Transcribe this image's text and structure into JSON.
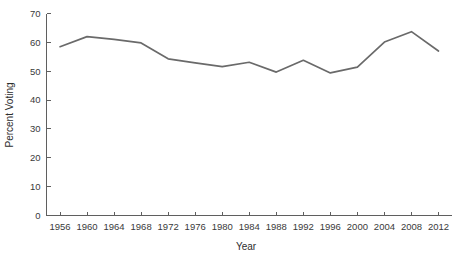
{
  "chart_data": {
    "type": "line",
    "title": "",
    "xlabel": "Year",
    "ylabel": "Percent Voting",
    "xlim": [
      1954,
      2014
    ],
    "ylim": [
      0,
      70
    ],
    "grid": false,
    "legend": "none",
    "x_ticks": [
      1956,
      1960,
      1964,
      1968,
      1972,
      1976,
      1980,
      1984,
      1988,
      1992,
      1996,
      2000,
      2004,
      2008,
      2012
    ],
    "y_ticks": [
      0,
      10,
      20,
      30,
      40,
      50,
      60,
      70
    ],
    "line_color": "#6a6a6a",
    "x": [
      1956,
      1960,
      1964,
      1968,
      1972,
      1976,
      1980,
      1984,
      1988,
      1992,
      1996,
      2000,
      2004,
      2008,
      2012
    ],
    "values": [
      58.5,
      62.0,
      61.0,
      59.8,
      54.3,
      52.9,
      51.6,
      53.1,
      49.7,
      53.8,
      49.4,
      51.4,
      60.1,
      63.7,
      57.0
    ],
    "series": [
      {
        "name": "Percent Voting",
        "values": [
          58.5,
          62.0,
          61.0,
          59.8,
          54.3,
          52.9,
          51.6,
          53.1,
          49.7,
          53.8,
          49.4,
          51.4,
          60.1,
          63.7,
          57.0
        ]
      }
    ]
  }
}
